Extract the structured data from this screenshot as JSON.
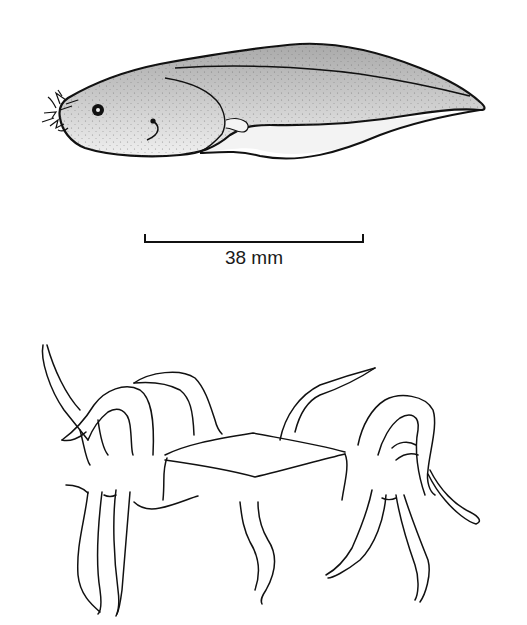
{
  "figure": {
    "top_panel": {
      "subject": "tadpole-illustration",
      "scale_bar": {
        "label": "38 mm",
        "x_start": 145,
        "x_end": 363,
        "y": 242
      }
    },
    "bottom_panel": {
      "subject": "tentacled-figure-line-drawing"
    },
    "colors": {
      "line": "#111111",
      "body_fill_dark": "#b8b8b8",
      "body_fill_light": "#e6e6e6",
      "background": "#ffffff"
    }
  }
}
